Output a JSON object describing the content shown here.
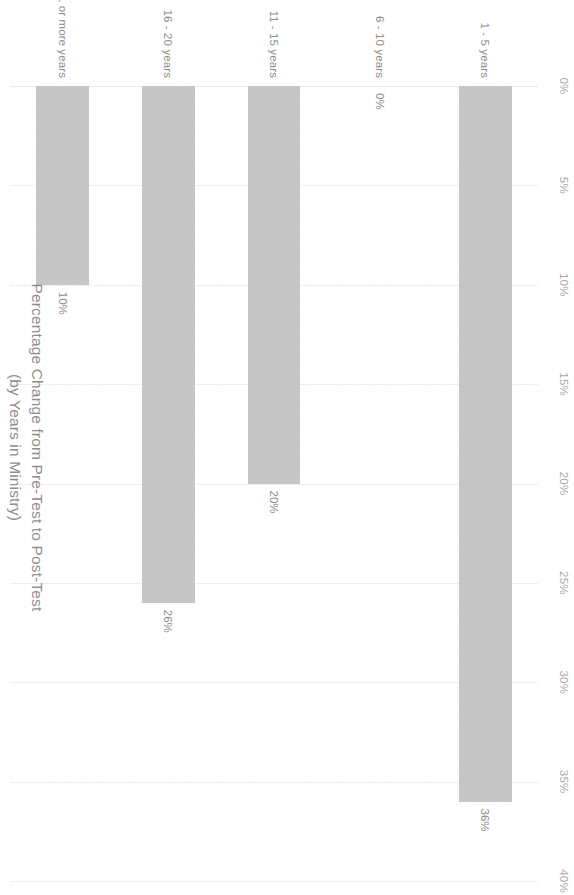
{
  "chart_data": {
    "type": "bar",
    "orientation": "horizontal",
    "title": "Percentage Change from Pre-Test to Post-Test",
    "subtitle": "(by Years in Ministry)",
    "title_lines": [
      "Percentage Change from Pre-Test to Post-Test",
      "(by Years in Ministry)"
    ],
    "xlabel": "",
    "ylabel": "",
    "categories": [
      "1 - 5 years",
      "6 - 10 years",
      "11 - 15 years",
      "16 - 20 years",
      "21 or more years"
    ],
    "values": [
      36,
      0,
      20,
      26,
      10
    ],
    "data_labels": [
      "36%",
      "0%",
      "20%",
      "26%",
      "10%"
    ],
    "xlim": [
      0,
      40
    ],
    "xticks": [
      0,
      5,
      10,
      15,
      20,
      25,
      30,
      35,
      40
    ],
    "xtick_labels": [
      "0%",
      "5%",
      "10%",
      "15%",
      "20%",
      "25%",
      "30%",
      "35%",
      "40%"
    ],
    "grid": true,
    "grid_axis": "x",
    "legend": false,
    "bar_color": "#c6c6c6",
    "text_color": "#8e8e8e",
    "grid_color": "#efefef",
    "background": "#ffffff",
    "page_rotation_degrees": 90
  }
}
